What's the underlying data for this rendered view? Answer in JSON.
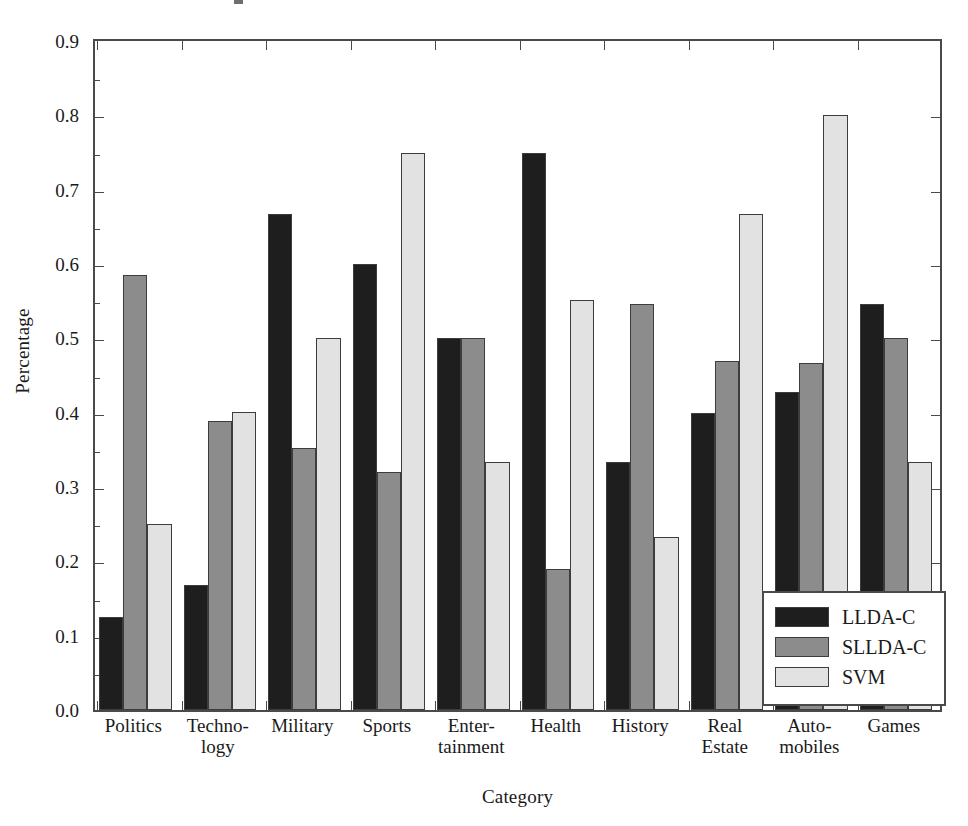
{
  "chart_data": {
    "type": "bar",
    "title": "",
    "xlabel": "Category",
    "ylabel": "Percentage",
    "ylim": [
      0.0,
      0.9
    ],
    "ytick_labels": [
      "0.0",
      "0.1",
      "0.2",
      "0.3",
      "0.4",
      "0.5",
      "0.6",
      "0.7",
      "0.8",
      "0.9"
    ],
    "ytick_values": [
      0.0,
      0.1,
      0.2,
      0.3,
      0.4,
      0.5,
      0.6,
      0.7,
      0.8,
      0.9
    ],
    "grid": false,
    "legend_position": "lower-right",
    "categories": [
      "Politics",
      "Techno-logy",
      "Military",
      "Sports",
      "Enter-tainment",
      "Health",
      "History",
      "Real Estate",
      "Auto-mobiles",
      "Games"
    ],
    "category_label_lines": [
      [
        "Politics",
        ""
      ],
      [
        "Techno-",
        "logy"
      ],
      [
        "Military",
        ""
      ],
      [
        "Sports",
        ""
      ],
      [
        "Enter-",
        "tainment"
      ],
      [
        "Health",
        ""
      ],
      [
        "History",
        ""
      ],
      [
        "Real",
        "Estate"
      ],
      [
        "Auto-",
        "mobiles"
      ],
      [
        "Games",
        ""
      ]
    ],
    "series": [
      {
        "name": "LLDA-C",
        "color": "#1e1e1e",
        "values": [
          0.125,
          0.168,
          0.667,
          0.6,
          0.5,
          0.75,
          0.333,
          0.4,
          0.428,
          0.546
        ]
      },
      {
        "name": "SLLDA-C",
        "color": "#8c8c8c",
        "values": [
          0.585,
          0.389,
          0.352,
          0.32,
          0.5,
          0.19,
          0.546,
          0.47,
          0.467,
          0.5
        ]
      },
      {
        "name": "SVM",
        "color": "#e2e2e2",
        "values": [
          0.25,
          0.401,
          0.5,
          0.75,
          0.333,
          0.552,
          0.233,
          0.667,
          0.8,
          0.333
        ]
      }
    ]
  },
  "legend": {
    "items": [
      {
        "label": "LLDA-C",
        "color": "#1e1e1e"
      },
      {
        "label": "SLLDA-C",
        "color": "#8c8c8c"
      },
      {
        "label": "SVM",
        "color": "#e2e2e2"
      }
    ]
  }
}
